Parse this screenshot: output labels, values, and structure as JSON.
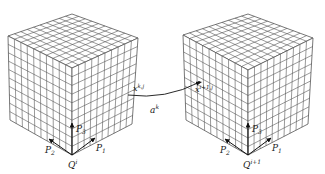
{
  "diagram": {
    "grid_divisions": 10,
    "line_color": "#555555",
    "cubes": [
      {
        "id": "cube-left",
        "origin_label": "Q",
        "origin_sup": "i",
        "top": [
          72,
          14
        ],
        "left": [
          8,
          36
        ],
        "right": [
          138,
          38
        ],
        "front": [
          72,
          68
        ],
        "bl": [
          10,
          120
        ],
        "br": [
          132,
          124
        ],
        "bottom": [
          72,
          155
        ],
        "point_label": "x",
        "point_sup": "k,j",
        "axes": {
          "p1": "P",
          "p1_sub": "1",
          "p2": "P",
          "p2_sub": "2",
          "p3": "P",
          "p3_sub": "3"
        }
      },
      {
        "id": "cube-right",
        "origin_label": "Q",
        "origin_sup": "i+1",
        "top": [
          248,
          14
        ],
        "left": [
          183,
          35
        ],
        "right": [
          313,
          38
        ],
        "front": [
          248,
          70
        ],
        "bl": [
          186,
          120
        ],
        "br": [
          308,
          124
        ],
        "bottom": [
          248,
          155
        ],
        "point_label": "x",
        "point_sup": "i+1,j",
        "axes": {
          "p1": "P",
          "p1_sub": "1",
          "p2": "P",
          "p2_sub": "2",
          "p3": "P",
          "p3_sub": "3"
        }
      }
    ],
    "transform_label": "a",
    "transform_sup": "k"
  }
}
